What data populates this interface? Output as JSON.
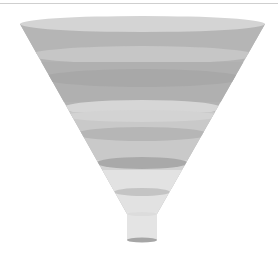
{
  "diagram": {
    "type": "funnel",
    "style": "3d-grayscale",
    "stage_count": 5,
    "colors": {
      "rim": "#d4d4d4",
      "stage_dark": "#b3b3b3",
      "stage_darker": "#a9a9a9",
      "stage_light": "#c6c6c6",
      "stage_lighter": "#d8d8d8",
      "neck": "#e4e4e4",
      "neck_bottom": "#a6a6a6",
      "top_rule": "#cfcfcf"
    }
  }
}
